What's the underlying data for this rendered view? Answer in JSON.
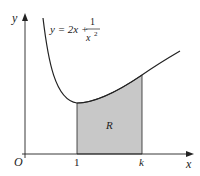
{
  "diagram": {
    "equation": {
      "lhs": "y = 2x +",
      "numerator": "1",
      "denominator": "x",
      "exponent": "2"
    },
    "axes": {
      "x_label": "x",
      "y_label": "y",
      "origin_label": "O"
    },
    "ticks": {
      "a": "1",
      "b": "k"
    },
    "region_label": "R",
    "colors": {
      "shade": "#c8c8c8",
      "line": "#222222"
    }
  }
}
